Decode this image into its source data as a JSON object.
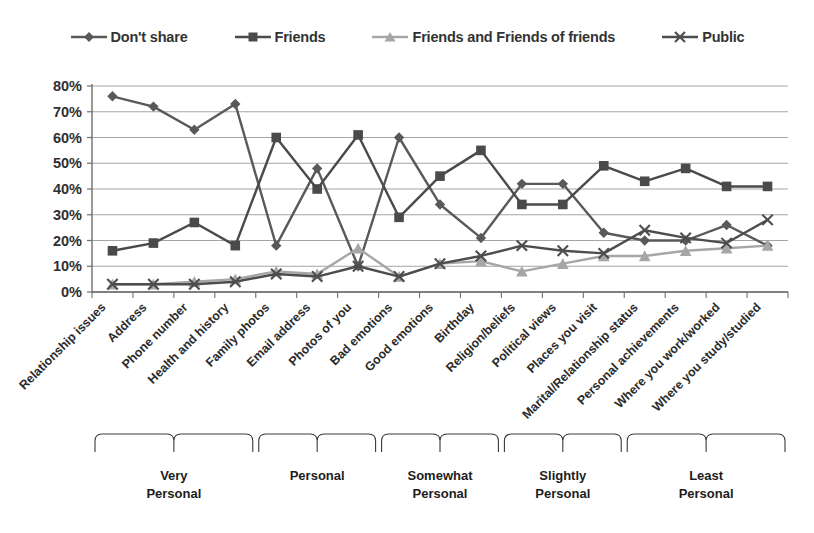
{
  "chart_data": {
    "type": "line",
    "title": "",
    "xlabel": "",
    "ylabel": "",
    "ylim": [
      0,
      80
    ],
    "ytick_labels": [
      "0%",
      "10%",
      "20%",
      "30%",
      "40%",
      "50%",
      "60%",
      "70%",
      "80%"
    ],
    "ytick_values": [
      0,
      10,
      20,
      30,
      40,
      50,
      60,
      70,
      80
    ],
    "grid": true,
    "legend_position": "top",
    "categories": [
      "Relationship issues",
      "Address",
      "Phone number",
      "Health and history",
      "Family photos",
      "Email address",
      "Photos of you",
      "Bad emotions",
      "Good emotions",
      "Birthday",
      "Religion/beliefs",
      "Political views",
      "Places you visit",
      "Marital/Relationship status",
      "Personal achievements",
      "Where you work/worked",
      "Where you study/studied"
    ],
    "series": [
      {
        "name": "Don't share",
        "marker": "diamond",
        "color": "#595959",
        "values": [
          76,
          72,
          63,
          73,
          18,
          48,
          10,
          60,
          34,
          21,
          42,
          42,
          23,
          20,
          20,
          26,
          18
        ]
      },
      {
        "name": "Friends",
        "marker": "square",
        "color": "#4a4a4a",
        "values": [
          16,
          19,
          27,
          18,
          60,
          40,
          61,
          29,
          45,
          55,
          34,
          34,
          49,
          43,
          48,
          41,
          41
        ]
      },
      {
        "name": "Friends and Friends of friends",
        "marker": "triangle",
        "color": "#a6a6a6",
        "values": [
          3,
          3,
          4,
          5,
          8,
          7,
          17,
          6,
          11,
          12,
          8,
          11,
          14,
          14,
          16,
          17,
          18
        ]
      },
      {
        "name": "Public",
        "marker": "x",
        "color": "#4d4d4d",
        "values": [
          3,
          3,
          3,
          4,
          7,
          6,
          10,
          6,
          11,
          14,
          18,
          16,
          15,
          24,
          21,
          19,
          28
        ]
      }
    ],
    "groups": [
      {
        "label_line1": "Very",
        "label_line2": "Personal",
        "start": 0,
        "end": 3
      },
      {
        "label_line1": "Personal",
        "label_line2": "",
        "start": 4,
        "end": 6
      },
      {
        "label_line1": "Somewhat",
        "label_line2": "Personal",
        "start": 7,
        "end": 9
      },
      {
        "label_line1": "Slightly",
        "label_line2": "Personal",
        "start": 10,
        "end": 12
      },
      {
        "label_line1": "Least",
        "label_line2": "Personal",
        "start": 13,
        "end": 16
      }
    ]
  },
  "legend": {
    "items": [
      {
        "label": "Don't share",
        "marker": "diamond",
        "color": "#595959"
      },
      {
        "label": "Friends",
        "marker": "square",
        "color": "#4a4a4a"
      },
      {
        "label": "Friends and Friends of friends",
        "marker": "triangle",
        "color": "#a6a6a6"
      },
      {
        "label": "Public",
        "marker": "x",
        "color": "#4d4d4d"
      }
    ]
  }
}
